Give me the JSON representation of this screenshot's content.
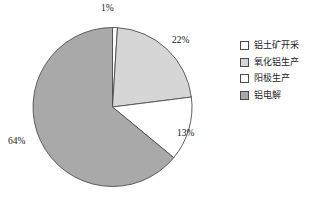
{
  "chart_data": {
    "type": "pie",
    "title": "",
    "subtitle": "",
    "xlabel": "",
    "ylabel": "",
    "grid": false,
    "legend_position": "right",
    "start_angle_deg": 0,
    "direction": "clockwise",
    "categories": [
      "铝土矿开采",
      "氧化铝生产",
      "阳极生产",
      "铝电解"
    ],
    "values": [
      1,
      22,
      13,
      64
    ],
    "value_unit": "%",
    "data_labels": [
      "1%",
      "22%",
      "13%",
      "64%"
    ],
    "colors": [
      "#fdfdfd",
      "#d6d6d6",
      "#ffffff",
      "#a9a9a9"
    ],
    "slice_border_color": "#4f4f4f",
    "slices": [
      {
        "label": "铝土矿开采",
        "value": 1,
        "data_label": "1%",
        "color": "#fdfdfd"
      },
      {
        "label": "氧化铝生产",
        "value": 22,
        "data_label": "22%",
        "color": "#d6d6d6"
      },
      {
        "label": "阳极生产",
        "value": 13,
        "data_label": "13%",
        "color": "#ffffff"
      },
      {
        "label": "铝电解",
        "value": 64,
        "data_label": "64%",
        "color": "#a9a9a9"
      }
    ]
  },
  "legend": {
    "items": [
      {
        "label": "铝土矿开采",
        "color": "#fdfdfd"
      },
      {
        "label": "氧化铝生产",
        "color": "#d6d6d6"
      },
      {
        "label": "阳极生产",
        "color": "#ffffff"
      },
      {
        "label": "铝电解",
        "color": "#a9a9a9"
      }
    ]
  }
}
